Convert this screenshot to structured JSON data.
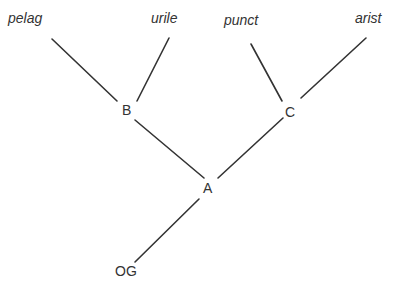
{
  "diagram": {
    "type": "phylogenetic-tree",
    "line_color": "#333333",
    "text_color": "#333333",
    "leaves": [
      {
        "id": "pelag",
        "label": "pelag",
        "x": 8,
        "y": 11
      },
      {
        "id": "urile",
        "label": "urile",
        "x": 151,
        "y": 11
      },
      {
        "id": "punct",
        "label": "punct",
        "x": 224,
        "y": 13
      },
      {
        "id": "arist",
        "label": "arist",
        "x": 355,
        "y": 11
      }
    ],
    "internal_nodes": [
      {
        "id": "B",
        "label": "B",
        "x": 122,
        "y": 103
      },
      {
        "id": "C",
        "label": "C",
        "x": 285,
        "y": 105
      },
      {
        "id": "A",
        "label": "A",
        "x": 203,
        "y": 181
      }
    ],
    "outgroup": {
      "id": "OG",
      "label": "OG",
      "x": 115,
      "y": 264
    },
    "edges": [
      {
        "from": "pelag",
        "to": "B"
      },
      {
        "from": "urile",
        "to": "B"
      },
      {
        "from": "punct",
        "to": "C"
      },
      {
        "from": "arist",
        "to": "C"
      },
      {
        "from": "B",
        "to": "A"
      },
      {
        "from": "C",
        "to": "A"
      },
      {
        "from": "A",
        "to": "OG"
      }
    ]
  }
}
